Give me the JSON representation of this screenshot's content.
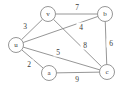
{
  "chart_data": {
    "type": "diagram",
    "diagram_kind": "weighted-undirected-graph",
    "title": "",
    "background_color": "#ffffff",
    "stroke_color": "#8a8a8a",
    "text_color": "#3a3a3a",
    "nodes": [
      {
        "id": "v",
        "label": "v",
        "x": 48,
        "y": 14,
        "r": 7.5
      },
      {
        "id": "b",
        "label": "b",
        "x": 105,
        "y": 14,
        "r": 7.5
      },
      {
        "id": "u",
        "label": "u",
        "x": 16,
        "y": 45,
        "r": 7.5
      },
      {
        "id": "a",
        "label": "a",
        "x": 49,
        "y": 73,
        "r": 7.5
      },
      {
        "id": "c",
        "label": "c",
        "x": 107,
        "y": 72,
        "r": 7.5
      }
    ],
    "edges": [
      {
        "id": "u-v",
        "source": "u",
        "target": "v",
        "weight": 3,
        "label_x": 25,
        "label_y": 26
      },
      {
        "id": "v-b",
        "source": "v",
        "target": "b",
        "weight": 7,
        "label_x": 77,
        "label_y": 7
      },
      {
        "id": "u-b",
        "source": "u",
        "target": "b",
        "weight": 4,
        "label_x": 81,
        "label_y": 27
      },
      {
        "id": "b-c",
        "source": "b",
        "target": "c",
        "weight": 6,
        "label_x": 111,
        "label_y": 43
      },
      {
        "id": "v-c",
        "source": "v",
        "target": "c",
        "weight": 8,
        "label_x": 85,
        "label_y": 45
      },
      {
        "id": "u-c",
        "source": "u",
        "target": "c",
        "weight": 5,
        "label_x": 58,
        "label_y": 52
      },
      {
        "id": "u-a",
        "source": "u",
        "target": "a",
        "weight": 2,
        "label_x": 29,
        "label_y": 64
      },
      {
        "id": "a-c",
        "source": "a",
        "target": "c",
        "weight": 9,
        "label_x": 77,
        "label_y": 79
      }
    ]
  }
}
